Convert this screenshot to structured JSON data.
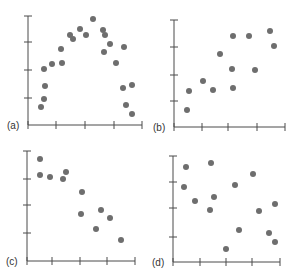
{
  "chart_data": [
    {
      "type": "scatter",
      "panel_label": "(a)",
      "title": "",
      "xlabel": "",
      "ylabel": "",
      "grid": false,
      "x_ticks": 5,
      "y_ticks": 4,
      "xlim": [
        0,
        4
      ],
      "ylim": [
        0,
        4
      ],
      "axes_px": {
        "x0": 28,
        "x1": 142,
        "y0": 125,
        "y1": 16
      },
      "x_tick_px": [
        28,
        56,
        85,
        114,
        142
      ],
      "y_tick_px": [
        16,
        42,
        70,
        98
      ],
      "pattern": "curvilinear (inverted U)",
      "points_px": [
        [
          41,
          107
        ],
        [
          44,
          99
        ],
        [
          45,
          86
        ],
        [
          44,
          69
        ],
        [
          52,
          64
        ],
        [
          62,
          63
        ],
        [
          61,
          49
        ],
        [
          70,
          35
        ],
        [
          73,
          39
        ],
        [
          80,
          29
        ],
        [
          86,
          35
        ],
        [
          93,
          19
        ],
        [
          103,
          30
        ],
        [
          105,
          35
        ],
        [
          110,
          44
        ],
        [
          104,
          52
        ],
        [
          116,
          63
        ],
        [
          124,
          47
        ],
        [
          123,
          88
        ],
        [
          132,
          85
        ],
        [
          126,
          105
        ],
        [
          132,
          114
        ]
      ]
    },
    {
      "type": "scatter",
      "panel_label": "(b)",
      "title": "",
      "xlabel": "",
      "ylabel": "",
      "grid": false,
      "x_ticks": 5,
      "y_ticks": 4,
      "xlim": [
        0,
        4
      ],
      "ylim": [
        0,
        4
      ],
      "axes_px": {
        "x0": 174,
        "x1": 285,
        "y0": 127,
        "y1": 20
      },
      "x_tick_px": [
        174,
        202,
        228,
        257,
        285
      ],
      "y_tick_px": [
        20,
        47,
        75,
        101
      ],
      "pattern": "positive linear",
      "points_px": [
        [
          187,
          110
        ],
        [
          189,
          91
        ],
        [
          203,
          81
        ],
        [
          213,
          90
        ],
        [
          220,
          54
        ],
        [
          233,
          36
        ],
        [
          232,
          69
        ],
        [
          233,
          88
        ],
        [
          249,
          36
        ],
        [
          255,
          70
        ],
        [
          270,
          31
        ],
        [
          274,
          46
        ]
      ]
    },
    {
      "type": "scatter",
      "panel_label": "(c)",
      "title": "",
      "xlabel": "",
      "ylabel": "",
      "grid": false,
      "x_ticks": 5,
      "y_ticks": 4,
      "xlim": [
        0,
        4
      ],
      "ylim": [
        0,
        4
      ],
      "axes_px": {
        "x0": 27,
        "x1": 135,
        "y0": 261,
        "y1": 151
      },
      "x_tick_px": [
        27,
        52,
        80,
        107,
        135
      ],
      "y_tick_px": [
        151,
        179,
        205,
        233
      ],
      "pattern": "negative linear",
      "points_px": [
        [
          40,
          159
        ],
        [
          40,
          175
        ],
        [
          50,
          177
        ],
        [
          63,
          179
        ],
        [
          66,
          172
        ],
        [
          82,
          192
        ],
        [
          81,
          214
        ],
        [
          101,
          210
        ],
        [
          110,
          218
        ],
        [
          96,
          229
        ],
        [
          121,
          240
        ]
      ]
    },
    {
      "type": "scatter",
      "panel_label": "(d)",
      "title": "",
      "xlabel": "",
      "ylabel": "",
      "grid": false,
      "x_ticks": 5,
      "y_ticks": 4,
      "xlim": [
        0,
        4
      ],
      "ylim": [
        0,
        4
      ],
      "axes_px": {
        "x0": 173,
        "x1": 280,
        "y0": 262,
        "y1": 156
      },
      "x_tick_px": [
        173,
        200,
        226,
        252,
        280
      ],
      "y_tick_px": [
        156,
        182,
        208,
        237
      ],
      "pattern": "no relationship",
      "points_px": [
        [
          186,
          167
        ],
        [
          184,
          187
        ],
        [
          195,
          201
        ],
        [
          211,
          163
        ],
        [
          214,
          197
        ],
        [
          210,
          210
        ],
        [
          235,
          185
        ],
        [
          253,
          174
        ],
        [
          239,
          230
        ],
        [
          226,
          249
        ],
        [
          259,
          211
        ],
        [
          275,
          204
        ],
        [
          269,
          233
        ],
        [
          275,
          242
        ]
      ]
    }
  ],
  "style": {
    "point_color": "#6e6e6e",
    "axis_color": "#4a4a4a",
    "point_radius": 3
  }
}
